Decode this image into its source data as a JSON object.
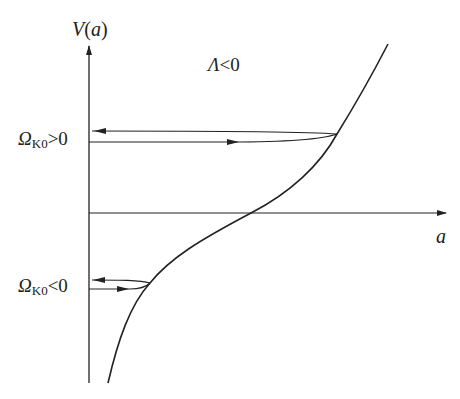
{
  "diagram": {
    "y_axis_label": "V(a)",
    "y_axis_label_parts": {
      "name": "V",
      "open": "(",
      "arg": "a",
      "close": ")"
    },
    "x_axis_label": "a",
    "condition_label": "Λ<0",
    "condition_parts": {
      "symbol": "Λ",
      "relation": "<0"
    },
    "levels": [
      {
        "label": "ΩK0>0",
        "symbol": "Ω",
        "subscript": "K0",
        "relation": ">0",
        "position": "above x-axis"
      },
      {
        "label": "ΩK0<0",
        "symbol": "Ω",
        "subscript": "K0",
        "relation": "<0",
        "position": "below x-axis"
      }
    ],
    "colors": {
      "line": "#222222",
      "background": "#ffffff"
    }
  }
}
